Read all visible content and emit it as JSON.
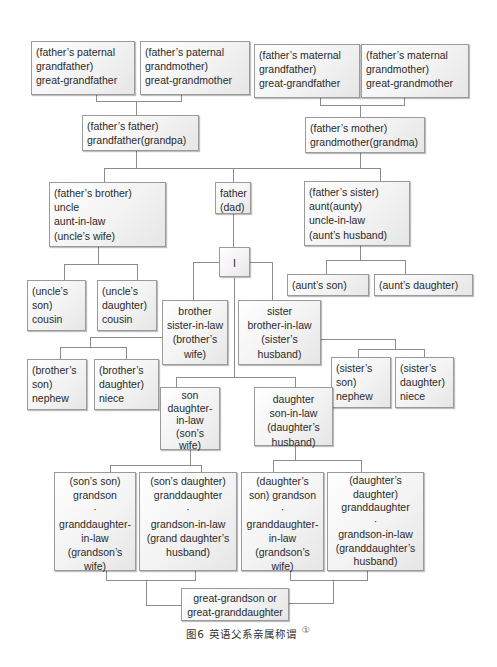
{
  "diagram": {
    "type": "family-tree",
    "caption": {
      "text": "图6   英语父系亲属称谓",
      "footnote_mark": "①"
    },
    "nodes": {
      "pgf": "(father’s paternal\ngrandfather)\ngreat-grandfather",
      "pgm": "(father’s paternal\ngrandmother)\ngreat-grandmother",
      "mgf": "(father’s maternal\ngrandfather)\ngreat-grandfather",
      "mgm": "(father’s maternal\ngrandmother)\ngreat-grandmother",
      "grandfather": "(father’s father)\ngrandfather(grandpa)",
      "grandmother": "(father’s mother)\ngrandmother(grandma)",
      "uncle": "(father’s brother)\nuncle\naunt-in-law\n(uncle’s wife)",
      "father": "father\n(dad)",
      "aunt": "(father’s sister)\naunt(aunty)\nuncle-in-law\n(aunt’s husband)",
      "me": "I",
      "uncle_son": "(uncle’s\nson)\ncousin",
      "uncle_daughter": "(uncle’s\ndaughter)\ncousin",
      "aunt_son": "(aunt’s son)",
      "aunt_daughter": "(aunt’s  daughter)",
      "brother": "brother\nsister-in-law\n(brother’s\nwife)",
      "sister": "sister\nbrother-in-law\n(sister’s\nhusband)",
      "brother_son": "(brother’s\nson)\nnephew",
      "brother_daughter": "(brother’s\ndaughter)\nniece",
      "sister_son": "(sister’s\nson)\nnephew",
      "sister_daughter": "(sister’s\ndaughter)\nniece",
      "son": "son\ndaughter-\nin-law\n(son’s\nwife)",
      "daughter": "daughter\nson-in-law\n(daughter’s\nhusband)",
      "son_son": "(son’s son)\ngrandson\n·\ngranddaughter-\nin-law\n(grandson’s\nwife)",
      "son_daughter": "(son’s daughter)\ngranddaughter\n·\ngrandson-in-law\n(grand daughter’s\nhusband)",
      "daughter_son": "(daughter’s\nson) grandson\n·\ngranddaughter-\nin-law\n(grandson’s\nwife)",
      "daughter_daughter": "(daughter’s\ndaughter)\ngranddaughter\n·\ngrandson-in-law\n(granddaughter’s\nhusband)",
      "great_grandchild": "great-grandson or\ngreat-granddaughter"
    }
  }
}
